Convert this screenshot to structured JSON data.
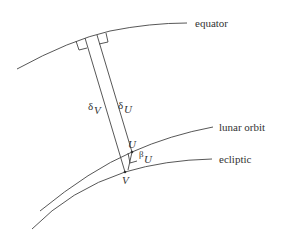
{
  "labels": {
    "equator": "equator",
    "lunar_orbit": "lunar orbit",
    "ecliptic": "ecliptic",
    "delta_v": "δ",
    "delta_v_sub": "V",
    "delta_u": "δ",
    "delta_u_sub": "U",
    "point_u": "U",
    "point_v": "V",
    "beta_u": "β",
    "beta_u_sub": "U"
  },
  "colors": {
    "line": "#444444",
    "text": "#333333",
    "background": "#ffffff"
  }
}
